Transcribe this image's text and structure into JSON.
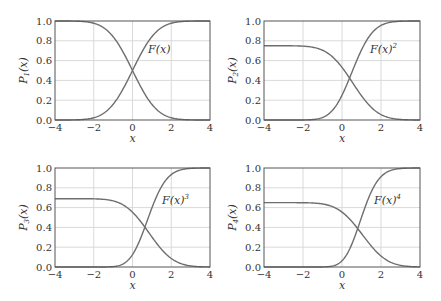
{
  "chart_data": [
    {
      "type": "line",
      "panel": "top-left",
      "xlabel": "x",
      "ylabel": "P1(x)",
      "xlim": [
        -4,
        4
      ],
      "ylim": [
        0,
        1
      ],
      "xticks": [
        "−4",
        "−2",
        "0",
        "2",
        "4"
      ],
      "yticks": [
        "0.0",
        "0.2",
        "0.4",
        "0.6",
        "0.8",
        "1.0"
      ],
      "grid": true,
      "annotation": "F(x)",
      "annotation_sup": "",
      "series": [
        {
          "name": "P1(x) (decreasing)",
          "plateau": 1.0,
          "shift": 0.0,
          "kind": "falling"
        },
        {
          "name": "F(x)",
          "power": 1,
          "kind": "rising"
        }
      ],
      "frame": {
        "x0": 55,
        "x1": 210,
        "y0": 21,
        "y1": 120
      },
      "label_pos": {
        "x": 148,
        "y": 53
      }
    },
    {
      "type": "line",
      "panel": "top-right",
      "xlabel": "x",
      "ylabel": "P2(x)",
      "xlim": [
        -4,
        4
      ],
      "ylim": [
        0,
        1
      ],
      "xticks": [
        "−4",
        "−2",
        "0",
        "2",
        "4"
      ],
      "yticks": [
        "0.0",
        "0.2",
        "0.4",
        "0.6",
        "0.8",
        "1.0"
      ],
      "grid": true,
      "annotation": "F(x)",
      "annotation_sup": "2",
      "series": [
        {
          "name": "P2(x) (decreasing)",
          "plateau": 0.75,
          "shift": 0.55,
          "kind": "falling"
        },
        {
          "name": "F(x)^2",
          "power": 2,
          "kind": "rising"
        }
      ],
      "frame": {
        "x0": 264,
        "x1": 420,
        "y0": 21,
        "y1": 120
      },
      "label_pos": {
        "x": 370,
        "y": 53
      }
    },
    {
      "type": "line",
      "panel": "bottom-left",
      "xlabel": "x",
      "ylabel": "P3(x)",
      "xlim": [
        -4,
        4
      ],
      "ylim": [
        0,
        1
      ],
      "xticks": [
        "−4",
        "−2",
        "0",
        "2",
        "4"
      ],
      "yticks": [
        "0.0",
        "0.2",
        "0.4",
        "0.6",
        "0.8",
        "1.0"
      ],
      "grid": true,
      "annotation": "F(x)",
      "annotation_sup": "3",
      "series": [
        {
          "name": "P3(x) (decreasing)",
          "plateau": 0.69,
          "shift": 0.85,
          "kind": "falling"
        },
        {
          "name": "F(x)^3",
          "power": 3,
          "kind": "rising"
        }
      ],
      "frame": {
        "x0": 55,
        "x1": 210,
        "y0": 168,
        "y1": 267
      },
      "label_pos": {
        "x": 162,
        "y": 204
      }
    },
    {
      "type": "line",
      "panel": "bottom-right",
      "xlabel": "x",
      "ylabel": "P4(x)",
      "xlim": [
        -4,
        4
      ],
      "ylim": [
        0,
        1
      ],
      "xticks": [
        "−4",
        "−2",
        "0",
        "2",
        "4"
      ],
      "yticks": [
        "0.0",
        "0.2",
        "0.4",
        "0.6",
        "0.8",
        "1.0"
      ],
      "grid": true,
      "annotation": "F(x)",
      "annotation_sup": "4",
      "series": [
        {
          "name": "P4(x) (decreasing)",
          "plateau": 0.65,
          "shift": 1.05,
          "kind": "falling"
        },
        {
          "name": "F(x)^4",
          "power": 4,
          "kind": "rising"
        }
      ],
      "frame": {
        "x0": 264,
        "x1": 420,
        "y0": 168,
        "y1": 267
      },
      "label_pos": {
        "x": 374,
        "y": 204
      }
    }
  ],
  "style": {
    "line_color": "#6e6e6e",
    "grid_color": "#d9d9d9",
    "frame_color": "#555555"
  }
}
